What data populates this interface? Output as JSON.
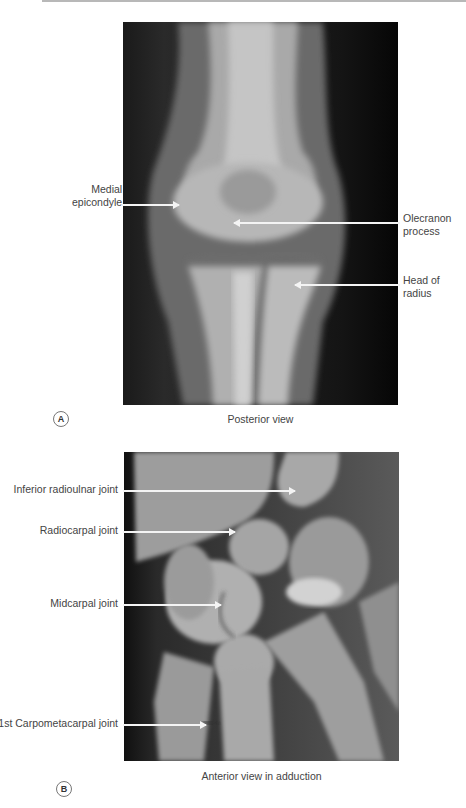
{
  "figure": {
    "panels": [
      {
        "letter": "A",
        "caption": "Posterior view",
        "subject": "elbow x-ray",
        "labels": [
          {
            "line1": "Medial",
            "line2": "epicondyle",
            "side": "left"
          },
          {
            "line1": "Olecranon",
            "line2": "process",
            "side": "right"
          },
          {
            "line1": "Head of",
            "line2": "radius",
            "side": "right"
          }
        ]
      },
      {
        "letter": "B",
        "caption": "Anterior view in adduction",
        "subject": "wrist x-ray",
        "labels": [
          {
            "text": "Inferior radioulnar joint",
            "side": "left"
          },
          {
            "text": "Radiocarpal joint",
            "side": "left"
          },
          {
            "text": "Midcarpal joint",
            "side": "left"
          },
          {
            "text": "1st Carpometacarpal joint",
            "side": "left"
          }
        ]
      }
    ]
  },
  "colors": {
    "background": "#ffffff",
    "label_text": "#444444",
    "arrow": "#f4f4f4",
    "xray_dark": "#111111",
    "xray_bone": "#c8c8c8"
  }
}
